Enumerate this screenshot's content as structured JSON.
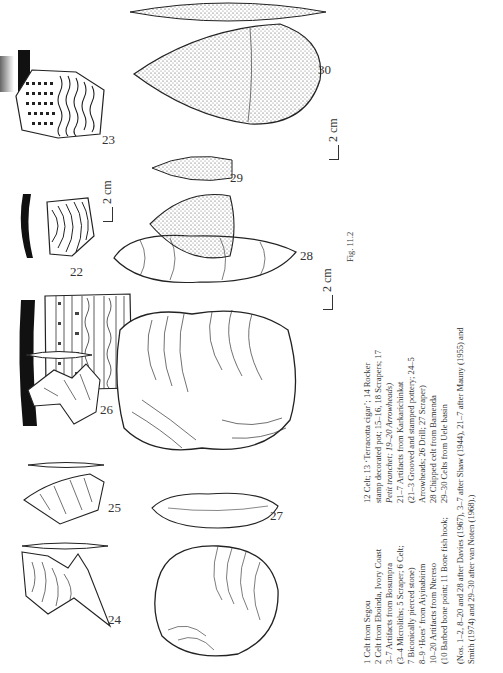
{
  "figure": {
    "label": "Fig. 11.2",
    "artifact_numbers": {
      "n21": "21",
      "n22": "22",
      "n23": "23",
      "n24": "24",
      "n25": "25",
      "n26": "26",
      "n27": "27",
      "n28": "28",
      "n29": "29",
      "n30": "30"
    },
    "scale_bars": {
      "s1": "2 cm",
      "s2": "2 cm",
      "s3": "2 cm"
    }
  },
  "caption": {
    "left": [
      "1  Celt from Segou",
      "2  Celt from Eboinda, Ivory Coast",
      "3–7  Artifacts from Bosumpra",
      "(3–4  Microliths; 5  Scraper; 6  Celt;",
      "  7  Biconically pierced stone)",
      "8–9  ‘Hoes’ from Aiyinabirim",
      "10–20  Artifacts from Ntereso",
      "(10  Barbed bone point; 11  Bone fish hook;"
    ],
    "right": [
      "12  Celt; 13  ‘Terracotta cigar’; 14  Rocker",
      "stamp decorated pot; 15–16, 18  Scrapers; 17",
      "Petit tranchet; 19–20  Arrowheads)",
      "21–7  Artifacts from Karkarichinkat",
      "(21–3  Grooved and stamped pottery; 24–5",
      "Arrowheads; 26  Drill; 27  Scraper)",
      "28  Chipped celt from Bamenda",
      "29–30  Celts from Uele basin"
    ],
    "sources": [
      "(Nos. 1–2, 8–20 and 28 after Davies (1967), 3–7 after Shaw (1944), 21–7 after Mauny (1955) and",
      "Smith (1974) and 29–30 after van Noten (1968).)"
    ]
  }
}
